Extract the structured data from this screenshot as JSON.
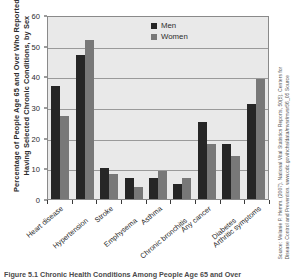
{
  "chart_data": {
    "type": "bar",
    "title": "",
    "ylabel_line1": "Percentage of People Age 65 and Over Who Reported",
    "ylabel_line2": "Having Selected Chronic Conditions, by Sex",
    "xlabel": "",
    "categories": [
      "Heart disease",
      "Hypertension",
      "Stroke",
      "Emphysema",
      "Asthma",
      "Chronic bronchitis",
      "Any cancer",
      "Diabetes",
      "Arthritic symptoms"
    ],
    "series": [
      {
        "name": "Men",
        "color": "#262626",
        "values": [
          37,
          47,
          10,
          7,
          7,
          5,
          25,
          18,
          31
        ]
      },
      {
        "name": "Women",
        "color": "#787878",
        "values": [
          27,
          52,
          8,
          4,
          9,
          7,
          18,
          14,
          39
        ]
      }
    ],
    "ylim": [
      0,
      60
    ],
    "yticks": [
      0,
      10,
      20,
      30,
      40,
      50,
      60
    ],
    "ytick_labels": [
      "0",
      "10",
      "20",
      "30",
      "40",
      "50",
      "60"
    ],
    "grid": true,
    "legend_position": "top-center",
    "plot_background": "#e9e9e9"
  },
  "legend": {
    "items": [
      {
        "label": "Men"
      },
      {
        "label": "Women"
      }
    ]
  },
  "source": {
    "line1": "Source: Melanie P. Hemm. (2007). National Vital Statistics Reports, 50(5). Centers for",
    "line2": "Disease Control and Prevention. www.cdc.gov/nchs/data/mvsr/mvsr56_05 Source"
  },
  "caption": {
    "text": "Figure 5.1 Chronic Health Conditions Among People Age 65 and Over"
  }
}
